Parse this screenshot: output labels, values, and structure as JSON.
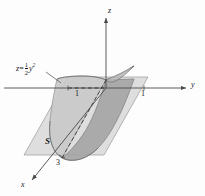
{
  "figure": {
    "name": "parabolic-cylinder-surface-diagram",
    "background_color": "#fdfdfd",
    "ink_color": "#1b1b1b"
  },
  "axes": {
    "z_label": "z",
    "y_label": "y",
    "x_label": "x"
  },
  "ticks": {
    "y_negative": "1",
    "y_positive": "1",
    "x_value": "3"
  },
  "labels": {
    "surface": "S",
    "equation_lhs": "z",
    "equation_eq": "=",
    "equation_numerator": "1",
    "equation_denominator": "2",
    "equation_var": "y",
    "equation_exponent": "2"
  },
  "colors": {
    "plane_fill": "#d8d8d8",
    "surface_fill_front": "#a8a8a8",
    "surface_fill_back": "#c4c4c4",
    "axis_stroke": "#4a4a4a",
    "outline_stroke": "#8a8a8a",
    "dashed_stroke": "#2b2b2b"
  }
}
